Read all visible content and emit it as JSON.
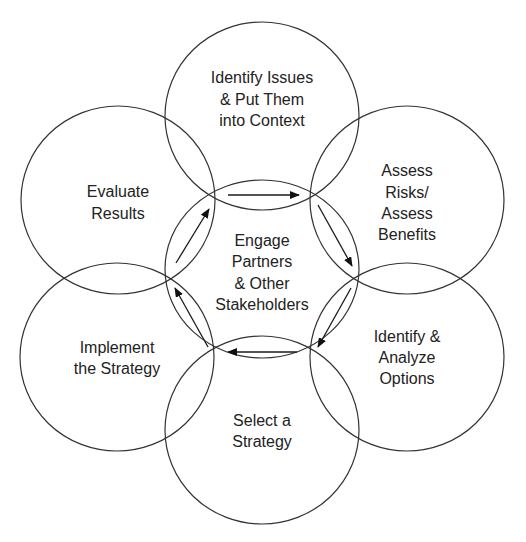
{
  "diagram": {
    "type": "cyclic-process-diagram",
    "center": {
      "lines": [
        "Engage",
        "Partners",
        "& Other",
        "Stakeholders"
      ]
    },
    "stages": [
      {
        "id": "identify-issues",
        "lines": [
          "Identify Issues",
          "& Put Them",
          "into Context"
        ]
      },
      {
        "id": "assess-risks",
        "lines": [
          "Assess",
          "Risks/",
          "Assess",
          "Benefits"
        ]
      },
      {
        "id": "analyze-options",
        "lines": [
          "Identify &",
          "Analyze",
          "Options"
        ]
      },
      {
        "id": "select-strategy",
        "lines": [
          "Select a",
          "Strategy"
        ]
      },
      {
        "id": "implement-strategy",
        "lines": [
          "Implement",
          "the Strategy"
        ]
      },
      {
        "id": "evaluate-results",
        "lines": [
          "Evaluate",
          "Results"
        ]
      }
    ],
    "flow_direction": "clockwise",
    "colors": {
      "stroke": "#333333",
      "text": "#222222",
      "background": "#ffffff"
    }
  }
}
